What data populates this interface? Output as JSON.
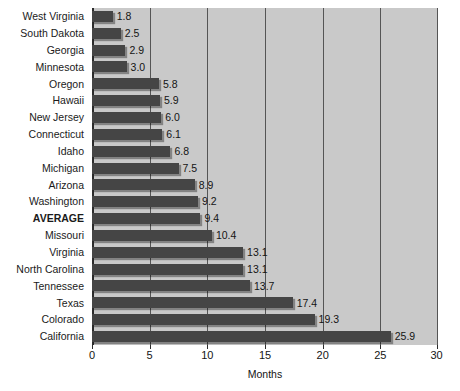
{
  "chart_data": {
    "type": "bar",
    "orientation": "horizontal",
    "title": "",
    "xlabel": "Months",
    "ylabel": "",
    "xlim": [
      0,
      30
    ],
    "xticks": [
      0,
      5,
      10,
      15,
      20,
      25,
      30
    ],
    "xtick_labels": [
      "0",
      "5",
      "10",
      "15",
      "20",
      "25",
      "30"
    ],
    "grid": true,
    "legend": false,
    "categories": [
      "West Virginia",
      "South Dakota",
      "Georgia",
      "Minnesota",
      "Oregon",
      "Hawaii",
      "New Jersey",
      "Connecticut",
      "Idaho",
      "Michigan",
      "Arizona",
      "Washington",
      "AVERAGE",
      "Missouri",
      "Virginia",
      "North Carolina",
      "Tennessee",
      "Texas",
      "Colorado",
      "California"
    ],
    "values": [
      1.8,
      2.5,
      2.9,
      3.0,
      5.8,
      5.9,
      6.0,
      6.1,
      6.8,
      7.5,
      8.9,
      9.2,
      9.4,
      10.4,
      13.1,
      13.1,
      13.7,
      17.4,
      19.3,
      25.9
    ],
    "value_labels": [
      "1.8",
      "2.5",
      "2.9",
      "3.0",
      "5.8",
      "5.9",
      "6.0",
      "6.1",
      "6.8",
      "7.5",
      "8.9",
      "9.2",
      "9.4",
      "10.4",
      "13.1",
      "13.1",
      "13.7",
      "17.4",
      "19.3",
      "25.9"
    ],
    "highlight_category": "AVERAGE",
    "colors": {
      "bar": "#454545",
      "plot_background": "#c9c9c9",
      "gridline": "#555555",
      "axis": "#2b2b2b",
      "text": "#141414",
      "page_background": "#ffffff"
    }
  }
}
